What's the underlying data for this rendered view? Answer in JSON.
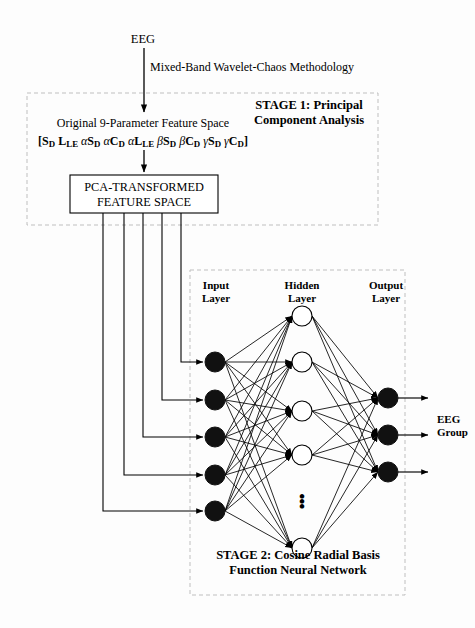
{
  "figure": {
    "background_color": "#fdfdfd",
    "line_color": "#000000",
    "dashed_box_color": "#bfbfbf",
    "node_fill_input": "#111111",
    "node_fill_hidden": "#ffffff",
    "node_fill_output": "#111111"
  },
  "flow": {
    "source_label": "EEG",
    "method_label": "Mixed-Band Wavelet-Chaos Methodology",
    "output_label_line1": "EEG",
    "output_label_line2": "Group"
  },
  "stage1": {
    "caption_line1": "STAGE 1: Principal",
    "caption_line2": "Component Analysis",
    "feature_space_label": "Original 9-Parameter Feature Space",
    "parameter_vector": "[S_D L_LE αS_D αC_D αL_LE βS_D βC_D γS_D γC_D]",
    "box_line1": "PCA-TRANSFORMED",
    "box_line2": "FEATURE SPACE"
  },
  "stage2": {
    "caption_line1": "STAGE 2: Cosine Radial Basis",
    "caption_line2": "Function Neural Network",
    "layers": [
      {
        "name": "input",
        "label_line1": "Input",
        "label_line2": "Layer",
        "node_count": 5,
        "style": "filled"
      },
      {
        "name": "hidden",
        "label_line1": "Hidden",
        "label_line2": "Layer",
        "node_count": 5,
        "style": "hollow",
        "ellipsis_between": [
          4,
          5
        ]
      },
      {
        "name": "output",
        "label_line1": "Output",
        "label_line2": "Layer",
        "node_count": 3,
        "style": "filled"
      }
    ],
    "ellipsis_glyph": "⋮"
  }
}
